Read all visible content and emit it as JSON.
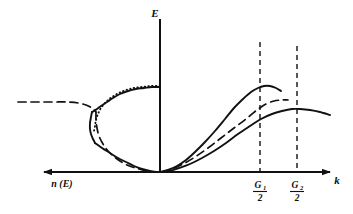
{
  "figure": {
    "background_color": "#ffffff",
    "ink_color": "#111111",
    "width": 353,
    "height": 214
  },
  "axes": {
    "vertical": {
      "name": "energy-axis",
      "label": "E",
      "origin_x": 160,
      "top_y": 20,
      "bottom_y": 172
    },
    "horizontal_right": {
      "name": "wavevector-axis",
      "label": "k",
      "label_x": 337,
      "label_y": 184,
      "y": 172,
      "from_x": 160,
      "to_x": 330
    },
    "horizontal_left": {
      "name": "density-of-states-axis",
      "label": "n (E)",
      "label_x": 62,
      "label_y": 187,
      "y": 172,
      "from_x": 160,
      "to_x": 44
    }
  },
  "ticks": [
    {
      "name": "tick-g1-half",
      "numerator": "G",
      "subscript": "1",
      "denominator": "2",
      "x": 260,
      "label_y": 188,
      "guide_top_y": 42,
      "guide_bottom_y": 172
    },
    {
      "name": "tick-g2-half",
      "numerator": "G",
      "subscript": "2",
      "denominator": "2",
      "x": 297,
      "label_y": 188,
      "guide_top_y": 46,
      "guide_bottom_y": 172
    }
  ],
  "chart_data": {
    "type": "line",
    "xlabel": "k",
    "ylabel": "E",
    "left_xlabel": "n (E)",
    "grid": false,
    "legend": "none",
    "xlim": [
      0,
      330
    ],
    "ylim": [
      0,
      172
    ],
    "axis_tick_labels": [
      "G1/2",
      "G2/2"
    ],
    "series": [
      {
        "name": "band-1-solid-right",
        "label": "First band (solid, peaks at G1/2)",
        "style": "solid",
        "side": "right",
        "stroke_width": 1.9,
        "points": [
          [
            160,
            172
          ],
          [
            168,
            170
          ],
          [
            177,
            166
          ],
          [
            186,
            160
          ],
          [
            195,
            152
          ],
          [
            205,
            142
          ],
          [
            215,
            131
          ],
          [
            225,
            119
          ],
          [
            234,
            108
          ],
          [
            243,
            99
          ],
          [
            251,
            92
          ],
          [
            258,
            88
          ],
          [
            264,
            86
          ],
          [
            270,
            86
          ],
          [
            276,
            88
          ],
          [
            281,
            91
          ]
        ]
      },
      {
        "name": "band-2-solid-right",
        "label": "Second band (solid, peaks at G2/2)",
        "style": "solid",
        "side": "right",
        "stroke_width": 1.9,
        "points": [
          [
            160,
            172
          ],
          [
            169,
            171
          ],
          [
            179,
            168
          ],
          [
            190,
            164
          ],
          [
            202,
            158
          ],
          [
            214,
            151
          ],
          [
            226,
            143
          ],
          [
            238,
            134
          ],
          [
            250,
            126
          ],
          [
            261,
            119
          ],
          [
            272,
            114
          ],
          [
            282,
            111
          ],
          [
            292,
            109
          ],
          [
            300,
            109
          ],
          [
            310,
            110
          ],
          [
            320,
            112
          ],
          [
            330,
            115
          ]
        ]
      },
      {
        "name": "free-electron-dashed-right",
        "label": "Free-electron parabola (dashed)",
        "style": "dashed",
        "side": "right",
        "stroke_width": 1.7,
        "points": [
          [
            162,
            172
          ],
          [
            172,
            169
          ],
          [
            183,
            164
          ],
          [
            195,
            157
          ],
          [
            208,
            148
          ],
          [
            221,
            138
          ],
          [
            234,
            128
          ],
          [
            246,
            119
          ],
          [
            257,
            110
          ],
          [
            266,
            104
          ],
          [
            274,
            101
          ],
          [
            282,
            100
          ],
          [
            288,
            100
          ]
        ]
      },
      {
        "name": "dos-solid-upper-left",
        "label": "Density of states upper branch (solid)",
        "style": "solid",
        "side": "left",
        "stroke_width": 1.9,
        "points": [
          [
            160,
            87
          ],
          [
            152,
            87
          ],
          [
            144,
            88
          ],
          [
            136,
            89
          ],
          [
            128,
            91
          ],
          [
            120,
            94
          ],
          [
            113,
            98
          ],
          [
            107,
            102
          ],
          [
            101,
            106
          ],
          [
            97,
            109
          ],
          [
            94,
            111
          ],
          [
            92,
            112
          ]
        ]
      },
      {
        "name": "dos-dotted-upper-left",
        "label": "Density of states upper branch (dotted overlay)",
        "style": "dotted",
        "side": "left",
        "stroke_width": 1.9,
        "points": [
          [
            160,
            86
          ],
          [
            151,
            86
          ],
          [
            142,
            87
          ],
          [
            134,
            88
          ],
          [
            126,
            90
          ],
          [
            119,
            93
          ],
          [
            112,
            97
          ],
          [
            106,
            102
          ],
          [
            101,
            108
          ],
          [
            98,
            114
          ],
          [
            96,
            120
          ],
          [
            95,
            126
          ],
          [
            94,
            131
          ]
        ]
      },
      {
        "name": "dos-cusp-left",
        "label": "Density of states van Hove cusp (solid)",
        "style": "solid",
        "side": "left",
        "stroke_width": 1.9,
        "points": [
          [
            92,
            112
          ],
          [
            91,
            117
          ],
          [
            90,
            123
          ],
          [
            90,
            129
          ],
          [
            91,
            134
          ],
          [
            93,
            139
          ],
          [
            95,
            143
          ]
        ]
      },
      {
        "name": "dos-solid-lower-left",
        "label": "Density of states lower branch (solid)",
        "style": "solid",
        "side": "left",
        "stroke_width": 1.9,
        "points": [
          [
            95,
            143
          ],
          [
            102,
            148
          ],
          [
            110,
            153
          ],
          [
            118,
            158
          ],
          [
            126,
            162
          ],
          [
            134,
            166
          ],
          [
            142,
            169
          ],
          [
            150,
            171
          ],
          [
            158,
            172
          ]
        ]
      },
      {
        "name": "dos-dashed-far-left",
        "label": "Density of states free-electron tail (dashed)",
        "style": "dashed",
        "side": "left",
        "stroke_width": 1.7,
        "points": [
          [
            18,
            102
          ],
          [
            30,
            102
          ],
          [
            42,
            102
          ],
          [
            54,
            102
          ],
          [
            66,
            102
          ],
          [
            78,
            103
          ],
          [
            86,
            105
          ],
          [
            92,
            108
          ],
          [
            96,
            112
          ]
        ]
      },
      {
        "name": "dos-dashed-lower-left",
        "label": "Density of states free-electron lower tail (dashed)",
        "style": "dashed",
        "side": "left",
        "stroke_width": 1.7,
        "points": [
          [
            96,
            112
          ],
          [
            96,
            120
          ],
          [
            97,
            128
          ],
          [
            99,
            136
          ],
          [
            103,
            144
          ],
          [
            109,
            152
          ],
          [
            117,
            159
          ],
          [
            127,
            165
          ],
          [
            139,
            169
          ],
          [
            151,
            172
          ]
        ]
      }
    ]
  }
}
